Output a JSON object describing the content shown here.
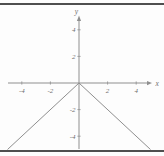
{
  "figure": {
    "background": "#fdfdfd",
    "rule_color": "#4f4f4f",
    "axis_color": "#8f8f8f",
    "curve_color": "#8f8f8f",
    "label_color": "#6f6f6f"
  },
  "chart_data": {
    "type": "line",
    "title": "",
    "xlabel": "x",
    "ylabel": "y",
    "xlim": [
      -5,
      5
    ],
    "ylim": [
      -5,
      5
    ],
    "x_ticks": [
      -4,
      -2,
      2,
      4
    ],
    "y_ticks": [
      4,
      2,
      -2,
      -4
    ],
    "grid": false,
    "legend_position": "none",
    "series": [
      {
        "name": "y = -|x|",
        "x": [
          -5,
          0,
          5
        ],
        "y": [
          -5,
          0,
          -5
        ]
      }
    ]
  }
}
